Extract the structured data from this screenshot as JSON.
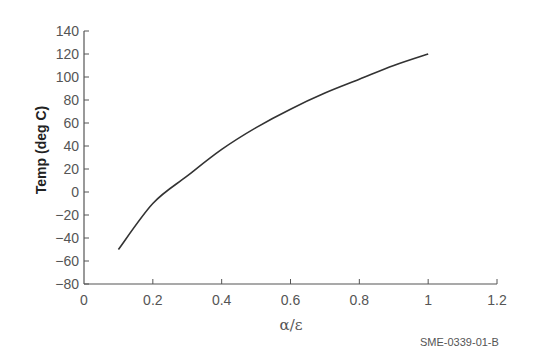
{
  "chart_data": {
    "type": "line",
    "title": "",
    "xlabel": "α/ε",
    "ylabel": "Temp (deg C)",
    "xlim": [
      0,
      1.2
    ],
    "ylim": [
      -80,
      140
    ],
    "xticks": [
      0,
      0.2,
      0.4,
      0.6,
      0.8,
      1,
      1.2
    ],
    "xtick_labels": [
      "0",
      "0.2",
      "0.4",
      "0.6",
      "0.8",
      "1",
      "1.2"
    ],
    "yticks": [
      -80,
      -60,
      -40,
      -20,
      0,
      20,
      40,
      60,
      80,
      100,
      120,
      140
    ],
    "ytick_labels": [
      "−80",
      "−60",
      "−40",
      "−20",
      "0",
      "20",
      "40",
      "60",
      "80",
      "100",
      "120",
      "140"
    ],
    "grid": false,
    "legend": null,
    "series": [
      {
        "name": "Temperature",
        "color": "#333333",
        "x": [
          0.1,
          0.2,
          0.3,
          0.4,
          0.5,
          0.6,
          0.7,
          0.8,
          0.9,
          1.0
        ],
        "y": [
          -50,
          -10,
          14,
          37,
          56,
          72,
          86,
          98,
          110,
          120
        ]
      }
    ],
    "annotations": [
      "SME-0339-01-B"
    ]
  },
  "figure_code": "SME-0339-01-B"
}
